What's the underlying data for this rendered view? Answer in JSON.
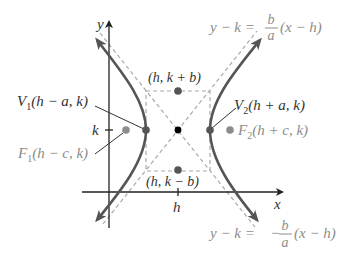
{
  "axes": {
    "x_label": "x",
    "y_label": "y",
    "h_tick_label": "h",
    "k_tick_label": "k"
  },
  "points": {
    "center": {
      "label": ""
    },
    "top_covertex": {
      "label": "(h, k + b)"
    },
    "bottom_covertex": {
      "label": "(h, k − b)"
    },
    "vertex1": {
      "label_main": "V",
      "label_sub": "1",
      "label_rest": "(h − a, k)"
    },
    "vertex2": {
      "label_main": "V",
      "label_sub": "2",
      "label_rest": "(h + a, k)"
    },
    "focus1": {
      "label_main": "F",
      "label_sub": "1",
      "label_rest": "(h − c, k)"
    },
    "focus2": {
      "label_main": "F",
      "label_sub": "2",
      "label_rest": "(h + c, k)"
    }
  },
  "asymptotes": {
    "upper": {
      "lhs": "y − k = ",
      "num": "b",
      "den": "a",
      "rhs": "(x − h)",
      "sign": ""
    },
    "lower": {
      "lhs": "y − k = ",
      "num": "b",
      "den": "a",
      "rhs": "(x − h)",
      "sign": "−"
    }
  },
  "colors": {
    "curve": "#555555",
    "asymptote": "#aaaaaa",
    "box": "#aaaaaa",
    "axis": "#222222",
    "vertex_dot": "#555555",
    "focus_dot": "#8c8c8c",
    "center_dot": "#000000",
    "label_gray": "#8c8c8c"
  }
}
